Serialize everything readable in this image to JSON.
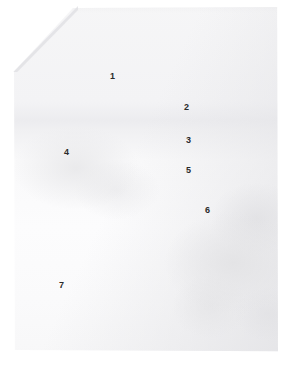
{
  "figure": {
    "kind": "annotated-specimen-photograph",
    "background_color": "#ffffff",
    "specimen_base_color": "#f7f7f8",
    "specimen_shadow_color": "#e3e3e6",
    "label_color": "#2a2a2a",
    "width": 292,
    "height": 365
  },
  "annotations": [
    {
      "id": "label-1",
      "text": "1",
      "x": 110,
      "y": 72
    },
    {
      "id": "label-2",
      "text": "2",
      "x": 184,
      "y": 103
    },
    {
      "id": "label-3",
      "text": "3",
      "x": 186,
      "y": 136
    },
    {
      "id": "label-4",
      "text": "4",
      "x": 64,
      "y": 148
    },
    {
      "id": "label-5",
      "text": "5",
      "x": 186,
      "y": 166
    },
    {
      "id": "label-6",
      "text": "6",
      "x": 205,
      "y": 206
    },
    {
      "id": "label-7",
      "text": "7",
      "x": 59,
      "y": 281
    }
  ]
}
